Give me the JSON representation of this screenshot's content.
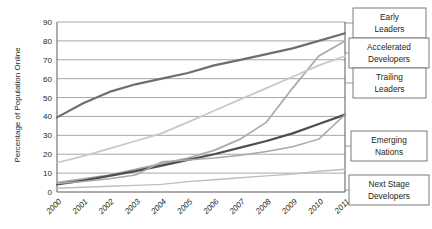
{
  "chart_data": {
    "type": "line",
    "title": "",
    "xlabel": "",
    "ylabel": "Percentage of Population Online",
    "categories": [
      "2000",
      "2001",
      "2002",
      "2003",
      "2004",
      "2005",
      "2006",
      "2007",
      "2008",
      "2009",
      "2010",
      "2011"
    ],
    "ylim": [
      0,
      90
    ],
    "ytick_step": 10,
    "yticks": [
      "0",
      "10",
      "20",
      "30",
      "40",
      "50",
      "60",
      "70",
      "80",
      "90"
    ],
    "grid": true,
    "legend_position": "right-callouts",
    "series": [
      {
        "name": "Early Leaders",
        "color": "#6d6e71",
        "width": 2.2,
        "values": [
          39.5,
          47,
          53,
          57,
          60,
          63,
          67,
          70,
          73,
          76,
          80,
          84
        ]
      },
      {
        "name": "Accelerated Developers",
        "color": "#a7a9ac",
        "width": 1.7,
        "values": [
          5,
          7,
          9,
          12,
          15,
          18,
          22,
          28,
          37,
          55,
          72,
          80
        ]
      },
      {
        "name": "Trailing Leaders",
        "color": "#c7c8ca",
        "width": 1.7,
        "values": [
          15.5,
          19,
          23,
          27,
          31,
          37,
          43,
          49,
          55,
          61,
          67,
          72
        ]
      },
      {
        "name": "Emerging Nations",
        "color": "#4d4e50",
        "width": 2.2,
        "values": [
          4,
          6,
          8.5,
          11,
          14,
          17,
          20,
          23.5,
          27,
          31,
          36,
          41
        ]
      },
      {
        "name": "Next Stage Developers",
        "color": "#a7a9ac",
        "width": 1.5,
        "values": [
          4.5,
          5.5,
          7,
          9,
          16,
          17,
          18,
          19.5,
          21.5,
          24,
          28,
          41
        ]
      },
      {
        "name": "Lower Trend",
        "color": "#bcbec0",
        "width": 1.4,
        "values": [
          2,
          2.5,
          3,
          3.5,
          4,
          5.5,
          6.5,
          7.5,
          8.5,
          9.5,
          11,
          12
        ]
      }
    ],
    "callouts": [
      {
        "label_lines": [
          "Early",
          "Leaders"
        ],
        "x": 353,
        "y": 8,
        "w": 73,
        "h": 30
      },
      {
        "label_lines": [
          "Accelerated",
          "Developers"
        ],
        "x": 349,
        "y": 38,
        "w": 80,
        "h": 30
      },
      {
        "label_lines": [
          "Trailing",
          "Leaders"
        ],
        "x": 353,
        "y": 68,
        "w": 73,
        "h": 30
      },
      {
        "label_lines": [
          "Emerging",
          "Nations"
        ],
        "x": 351,
        "y": 131,
        "w": 76,
        "h": 30
      },
      {
        "label_lines": [
          "Next Stage",
          "Developers"
        ],
        "x": 349,
        "y": 175,
        "w": 80,
        "h": 30
      }
    ]
  }
}
